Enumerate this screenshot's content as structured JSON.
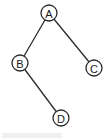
{
  "diagram": {
    "type": "binary-tree",
    "nodes": [
      {
        "id": "A",
        "label": "A"
      },
      {
        "id": "B",
        "label": "B"
      },
      {
        "id": "C",
        "label": "C"
      },
      {
        "id": "D",
        "label": "D"
      }
    ],
    "edges": [
      {
        "from": "A",
        "to": "B"
      },
      {
        "from": "A",
        "to": "C"
      },
      {
        "from": "B",
        "to": "D"
      }
    ],
    "colors": {
      "stroke": "#2b2b2b",
      "fill": "#ffffff",
      "text": "#1a1a1a"
    }
  }
}
